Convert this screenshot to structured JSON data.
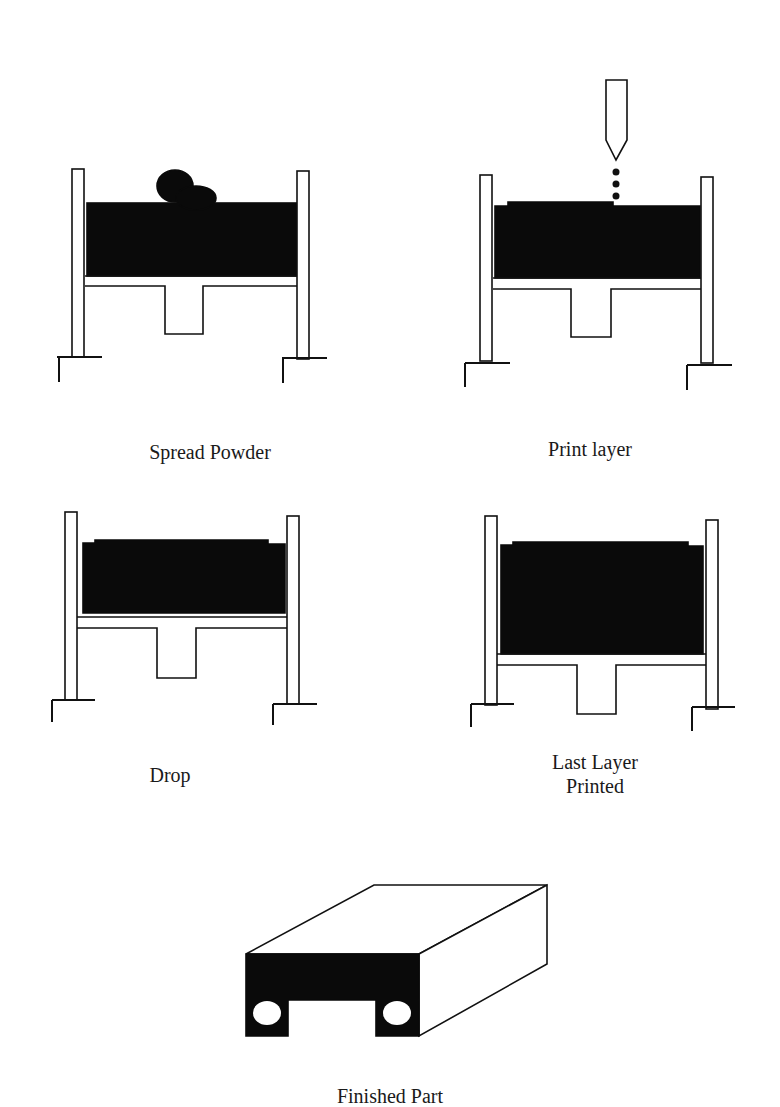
{
  "diagram": {
    "type": "process-steps",
    "colors": {
      "line": "#111111",
      "powder": "#0a0a0a",
      "background": "#ffffff"
    },
    "steps": [
      {
        "id": "spread-powder",
        "label": "Spread Powder"
      },
      {
        "id": "print-layer",
        "label": "Print layer"
      },
      {
        "id": "drop",
        "label": "Drop"
      },
      {
        "id": "last-layer-printed",
        "label": "Last Layer Printed",
        "label_line1": "Last Layer",
        "label_line2": "Printed"
      },
      {
        "id": "finished-part",
        "label": "Finished Part"
      }
    ]
  }
}
